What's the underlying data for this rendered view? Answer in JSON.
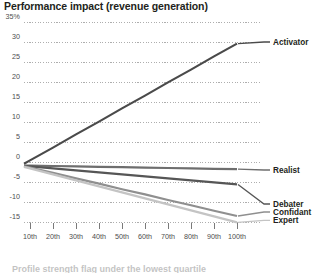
{
  "chart_data": {
    "type": "line",
    "title": "Performance impact (revenue generation)",
    "xlabel": "",
    "ylabel": "",
    "x": [
      10,
      20,
      30,
      40,
      50,
      60,
      70,
      80,
      90,
      100
    ],
    "categories": [
      "10th",
      "20th",
      "30th",
      "40th",
      "50th",
      "60th",
      "70th",
      "80th",
      "90th",
      "100th"
    ],
    "ylim": [
      -15,
      35
    ],
    "xlim": [
      0,
      100
    ],
    "yticks": [
      -15,
      -10,
      -5,
      0,
      5,
      10,
      15,
      20,
      25,
      30,
      35
    ],
    "ytick_labels": [
      "-15",
      "-10",
      "-5",
      "0",
      "5",
      "10",
      "15",
      "20",
      "25",
      "30",
      "35%"
    ],
    "grid": true,
    "grid_style": "dotted",
    "legend_position": "right-inline",
    "series": [
      {
        "name": "Activator",
        "color": "#4a4a4a",
        "values": [
          0.4,
          3.6,
          6.9,
          10.1,
          13.4,
          16.6,
          19.9,
          23.1,
          26.4,
          29.6
        ],
        "label_y": 30
      },
      {
        "name": "Realist",
        "color": "#6e6e6e",
        "values": [
          -0.9,
          -1.0,
          -1.1,
          -1.2,
          -1.3,
          -1.4,
          -1.5,
          -1.6,
          -1.7,
          -1.8
        ],
        "label_y": -2
      },
      {
        "name": "Debater",
        "color": "#565656",
        "values": [
          -1.1,
          -1.6,
          -2.1,
          -2.6,
          -3.1,
          -3.6,
          -4.1,
          -4.6,
          -5.1,
          -5.6
        ],
        "label_y": -10.5
      },
      {
        "name": "Confidant",
        "color": "#8f8f8f",
        "values": [
          -1.4,
          -2.7,
          -4.1,
          -5.4,
          -6.8,
          -8.1,
          -9.5,
          -10.8,
          -12.2,
          -13.5
        ],
        "label_y": -12.5
      },
      {
        "name": "Expert",
        "color": "#c4c4c4",
        "values": [
          -1.6,
          -3.1,
          -4.6,
          -6.1,
          -7.6,
          -9.1,
          -10.6,
          -12.1,
          -13.6,
          -15.1
        ],
        "label_y": -14.6
      }
    ]
  },
  "caption": {
    "text": "Profile strength flag under the lowest quartile"
  },
  "colors": {
    "grid": "#9a9a9a",
    "text": "#231f20",
    "tick_text": "#4d4d4d",
    "background": "#ffffff"
  }
}
